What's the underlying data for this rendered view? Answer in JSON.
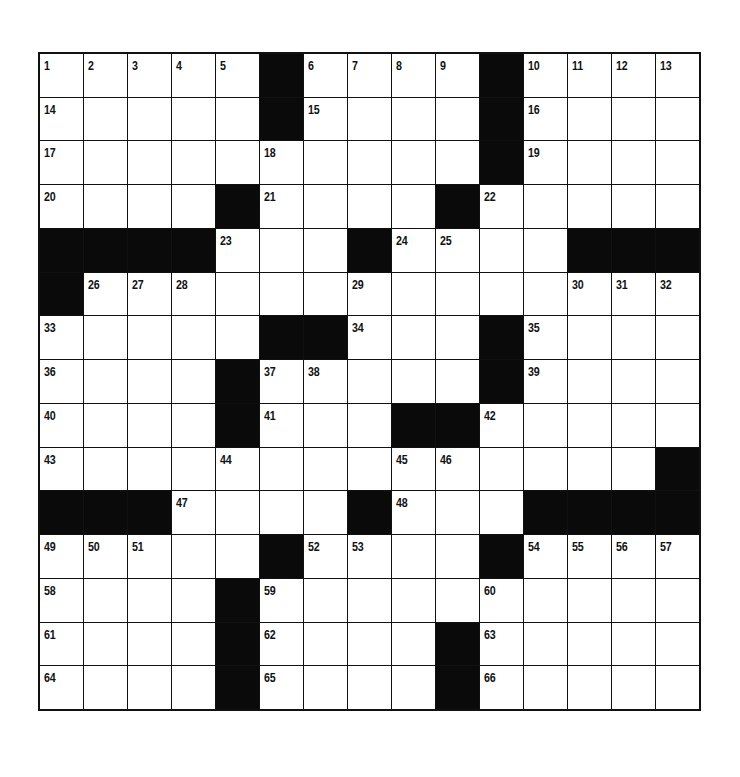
{
  "puzzle": {
    "rows": 15,
    "cols": 15,
    "colors": {
      "block": "#0a0a0a",
      "cell": "#ffffff",
      "line": "#111111"
    },
    "layout": [
      "....#....#....",
      "x"
    ],
    "grid": [
      [
        1,
        2,
        3,
        4,
        5,
        "#",
        6,
        7,
        8,
        9,
        "#",
        10,
        11,
        12,
        13
      ],
      [
        14,
        0,
        0,
        0,
        0,
        "#",
        15,
        0,
        0,
        0,
        "#",
        16,
        0,
        0,
        0
      ],
      [
        17,
        0,
        0,
        0,
        0,
        18,
        0,
        0,
        0,
        0,
        "#",
        19,
        0,
        0,
        0
      ],
      [
        20,
        0,
        0,
        0,
        "#",
        21,
        0,
        0,
        0,
        "#",
        22,
        0,
        0,
        0,
        0
      ],
      [
        "#",
        "#",
        "#",
        "#",
        23,
        0,
        0,
        "#",
        24,
        25,
        0,
        0,
        "#",
        "#",
        "#"
      ],
      [
        "#",
        26,
        27,
        28,
        0,
        0,
        0,
        29,
        0,
        0,
        0,
        0,
        30,
        31,
        32
      ],
      [
        33,
        0,
        0,
        0,
        0,
        "#",
        "#",
        34,
        0,
        0,
        "#",
        35,
        0,
        0,
        0
      ],
      [
        36,
        0,
        0,
        0,
        "#",
        37,
        38,
        0,
        0,
        0,
        "#",
        39,
        0,
        0,
        0
      ],
      [
        40,
        0,
        0,
        0,
        "#",
        41,
        0,
        0,
        "#",
        "#",
        42,
        0,
        0,
        0,
        0
      ],
      [
        43,
        0,
        0,
        0,
        44,
        0,
        0,
        0,
        45,
        46,
        0,
        0,
        0,
        0,
        "#"
      ],
      [
        "#",
        "#",
        "#",
        47,
        0,
        0,
        0,
        "#",
        48,
        0,
        0,
        "#",
        "#",
        "#",
        "#"
      ],
      [
        49,
        50,
        51,
        0,
        0,
        "#",
        52,
        53,
        0,
        0,
        "#",
        54,
        55,
        56,
        57
      ],
      [
        58,
        0,
        0,
        0,
        "#",
        59,
        0,
        0,
        0,
        0,
        60,
        0,
        0,
        0,
        0
      ],
      [
        61,
        0,
        0,
        0,
        "#",
        62,
        0,
        0,
        0,
        "#",
        63,
        0,
        0,
        0,
        0
      ],
      [
        64,
        0,
        0,
        0,
        "#",
        65,
        0,
        0,
        0,
        "#",
        66,
        0,
        0,
        0,
        0
      ]
    ]
  }
}
